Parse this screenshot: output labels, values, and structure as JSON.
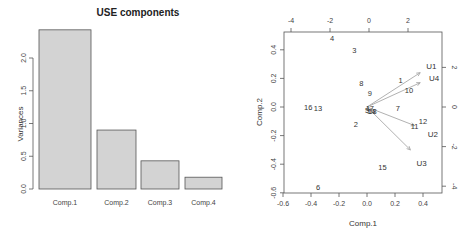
{
  "chart_data": [
    {
      "type": "bar",
      "title": "USE components",
      "xlabel": "",
      "ylabel": "Variances",
      "categories": [
        "Comp.1",
        "Comp.2",
        "Comp.3",
        "Comp.4"
      ],
      "values": [
        2.43,
        0.9,
        0.43,
        0.18
      ],
      "ylim": [
        0,
        2.5
      ],
      "yticks": [
        0.0,
        0.5,
        1.0,
        1.5,
        2.0
      ],
      "ytick_labels": [
        "0.0",
        "0.5",
        "1.0",
        "1.5",
        "2.0"
      ],
      "bar_color": "#d3d3d3",
      "grid": false
    },
    {
      "type": "scatter",
      "subtype": "biplot",
      "title": "",
      "xlabel": "Comp.1",
      "ylabel": "Comp.2",
      "xlim": [
        -0.62,
        0.5
      ],
      "ylim": [
        -0.6,
        0.52
      ],
      "xticks": [
        -0.6,
        -0.4,
        -0.2,
        0.0,
        0.2,
        0.4
      ],
      "xtick_labels": [
        "-0.6",
        "-0.4",
        "-0.2",
        "0.0",
        "0.2",
        "0.4"
      ],
      "yticks": [
        -0.6,
        -0.4,
        -0.2,
        0.0,
        0.2,
        0.4
      ],
      "ytick_labels": [
        "-0.6",
        "-0.4",
        "-0.2",
        "0.0",
        "0.2",
        "0.4"
      ],
      "top_ticks": [
        -4,
        -2,
        0,
        2
      ],
      "top_tick_labels": [
        "-4",
        "-2",
        "0",
        "2"
      ],
      "right_ticks": [
        -4,
        -2,
        0,
        2
      ],
      "right_tick_labels": [
        "-4",
        "-2",
        "0",
        "2"
      ],
      "points": [
        {
          "label": "1",
          "x": 0.24,
          "y": 0.19
        },
        {
          "label": "2",
          "x": -0.08,
          "y": -0.12
        },
        {
          "label": "3",
          "x": -0.09,
          "y": 0.4
        },
        {
          "label": "4",
          "x": -0.25,
          "y": 0.48
        },
        {
          "label": "5",
          "x": 0.0,
          "y": -0.02
        },
        {
          "label": "6",
          "x": -0.35,
          "y": -0.56
        },
        {
          "label": "7",
          "x": 0.22,
          "y": -0.01
        },
        {
          "label": "8",
          "x": -0.04,
          "y": 0.17
        },
        {
          "label": "9",
          "x": 0.02,
          "y": 0.1
        },
        {
          "label": "10",
          "x": 0.3,
          "y": 0.12
        },
        {
          "label": "11",
          "x": 0.34,
          "y": -0.13
        },
        {
          "label": "12",
          "x": 0.4,
          "y": -0.1
        },
        {
          "label": "13",
          "x": -0.35,
          "y": -0.01
        },
        {
          "label": "14",
          "x": 0.03,
          "y": -0.03
        },
        {
          "label": "15",
          "x": 0.11,
          "y": -0.42
        },
        {
          "label": "16",
          "x": -0.42,
          "y": 0.0
        },
        {
          "label": "17",
          "x": 0.02,
          "y": -0.01
        },
        {
          "label": "18",
          "x": 0.04,
          "y": -0.03
        }
      ],
      "loadings": [
        {
          "label": "U1",
          "x": 0.38,
          "y": 0.24,
          "label_x": 0.46,
          "label_y": 0.29
        },
        {
          "label": "U4",
          "x": 0.38,
          "y": 0.17,
          "label_x": 0.48,
          "label_y": 0.2
        },
        {
          "label": "U2",
          "x": 0.34,
          "y": -0.13,
          "label_x": 0.47,
          "label_y": -0.19
        },
        {
          "label": "U3",
          "x": 0.31,
          "y": -0.3,
          "label_x": 0.39,
          "label_y": -0.39
        }
      ],
      "arrow_color": "#a8a8a8"
    }
  ]
}
